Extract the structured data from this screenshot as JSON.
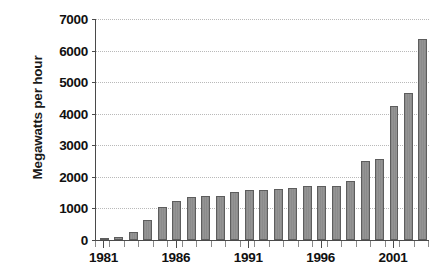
{
  "chart_data": {
    "type": "bar",
    "title": "",
    "xlabel": "",
    "ylabel": "Megawatts per hour",
    "ylim": [
      0,
      7000
    ],
    "ytick_step": 1000,
    "yticks": [
      0,
      1000,
      2000,
      3000,
      4000,
      5000,
      6000,
      7000
    ],
    "ytick_labels": [
      "0",
      "1000",
      "2000",
      "3000",
      "4000",
      "5000",
      "6000",
      "7000"
    ],
    "grid": "horizontal-dotted",
    "legend": "none",
    "xtick_labels": [
      "1981",
      "1986",
      "1991",
      "1996",
      "2001"
    ],
    "xtick_label_years": [
      1981,
      1986,
      1991,
      1996,
      2001
    ],
    "categories": [
      "1981",
      "1982",
      "1983",
      "1984",
      "1985",
      "1986",
      "1987",
      "1988",
      "1989",
      "1990",
      "1991",
      "1992",
      "1993",
      "1994",
      "1995",
      "1996",
      "1997",
      "1998",
      "1999",
      "2000",
      "2001",
      "2002",
      "2003"
    ],
    "values": [
      50,
      105,
      250,
      640,
      1060,
      1230,
      1350,
      1400,
      1400,
      1530,
      1580,
      1590,
      1620,
      1660,
      1710,
      1710,
      1720,
      1860,
      2510,
      2570,
      4260,
      4660,
      6360
    ],
    "bar_color": "#8f8f8f",
    "bar_edge_color": "#5d5d5d",
    "axis_color": "#4a4a4a",
    "gridline_color": "#b9b9b9",
    "text_color": "#111111",
    "background_color": "#ffffff"
  }
}
